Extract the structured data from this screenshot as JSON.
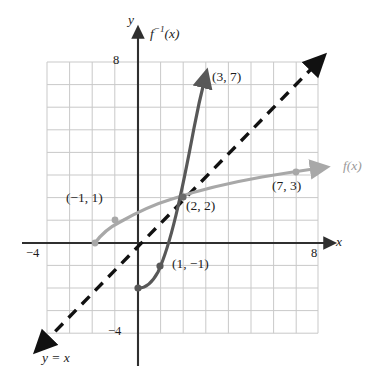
{
  "figure": {
    "background": "#ffffff",
    "colors": {
      "grid": "#c9c9c9",
      "axis": "#2f2f2f",
      "f_curve": "#a8a8a8",
      "f_inverse_curve": "#585858",
      "identity_line": "#111111",
      "text": "#1c1c1c",
      "f_label_text": "#9a9a9a"
    },
    "axes": {
      "x_label": "x",
      "y_label": "y",
      "x_ticks": [
        {
          "text": "−4",
          "value": -4,
          "px": {
            "x": 30,
            "y": 252
          }
        },
        {
          "text": "8",
          "value": 8,
          "px": {
            "x": 311,
            "y": 252
          }
        }
      ],
      "y_ticks": [
        {
          "text": "8",
          "value": 8,
          "px": {
            "x": 113,
            "y": 53
          }
        },
        {
          "text": "−4",
          "value": -4,
          "px": {
            "x": 110,
            "y": 326
          }
        }
      ],
      "x_range": [
        -4.6,
        9.8
      ],
      "y_range": [
        -5.0,
        8.9
      ],
      "grid": true,
      "grid_step": 1,
      "grid_extent": {
        "x_min": -4,
        "x_max": 8,
        "y_min": -4,
        "y_max": 8
      },
      "origin_px": {
        "x": 138,
        "y": 243
      },
      "unit_px": 22.6
    },
    "curve_labels": [
      {
        "name": "f-inverse-label",
        "text": "f",
        "sup": "−1",
        "suffix": "(x)",
        "px": {
          "x": 150,
          "y": 26
        },
        "color": "#1c1c1c"
      },
      {
        "name": "f-label",
        "text": "f(x)",
        "px": {
          "x": 344,
          "y": 160
        },
        "color": "#9a9a9a"
      },
      {
        "name": "identity-line-label",
        "text": "y = x",
        "px": {
          "x": 42,
          "y": 352
        },
        "color": "#1c1c1c"
      }
    ],
    "points": [
      {
        "label": "(−1, 1)",
        "x": -1,
        "y": 1,
        "on": "f-inverse",
        "label_px": {
          "x": 66,
          "y": 192
        },
        "marker": false
      },
      {
        "label": "(2, 2)",
        "x": 2,
        "y": 2,
        "on": "intersection",
        "label_px": {
          "x": 173,
          "y": 199
        },
        "marker": true
      },
      {
        "label": "(3, 7)",
        "x": 3,
        "y": 7,
        "on": "f-inverse",
        "label_px": {
          "x": 212,
          "y": 70
        },
        "marker": true
      },
      {
        "label": "(1, −1)",
        "x": 1,
        "y": -1,
        "on": "f-inverse",
        "label_px": {
          "x": 172,
          "y": 256
        },
        "marker": true
      },
      {
        "label": "(7, 3)",
        "x": 7,
        "y": 3,
        "on": "f",
        "label_px": {
          "x": 272,
          "y": 177
        },
        "marker": true
      }
    ],
    "series": [
      {
        "name": "f",
        "style": "solid",
        "color": "#a8a8a8",
        "width": 3.2,
        "arrow_end": true,
        "points_px": "M 95,243 C 100,236 108,228 120,222 C 134,214 152,205 172,199 C 196,191 228,183 262,177 C 286,173 306,170 322,168"
      },
      {
        "name": "f-inverse",
        "style": "solid",
        "color": "#585858",
        "width": 3.2,
        "arrow_end": true,
        "points_px": "M 138,288 C 145,288 152,283 158,272 C 164,259 170,240 176,215 C 182,190 188,160 194,128 C 198,107 202,90 206,76"
      },
      {
        "name": "y = x",
        "style": "dashed",
        "color": "#111111",
        "width": 3.4,
        "arrow_start": true,
        "arrow_end": true,
        "points_px": "M 42,345 L 318,62"
      }
    ]
  }
}
